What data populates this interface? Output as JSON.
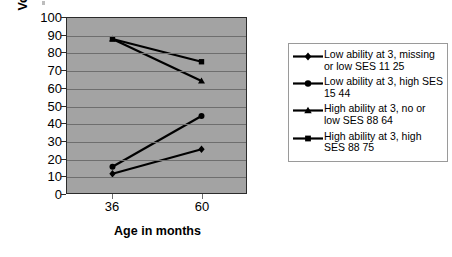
{
  "chart_data": {
    "type": "line",
    "title": "",
    "xlabel": "Age in months",
    "ylabel": "Vocab test percentile",
    "categories": [
      "36",
      "60"
    ],
    "x": [
      36,
      60
    ],
    "ylim": [
      0,
      100
    ],
    "ytick_labels": [
      "100",
      "90",
      "80",
      "70",
      "60",
      "50",
      "40",
      "30",
      "20",
      "10",
      "0"
    ],
    "ytick_values": [
      100,
      90,
      80,
      70,
      60,
      50,
      40,
      30,
      20,
      10,
      0
    ],
    "grid": true,
    "legend_position": "right",
    "series": [
      {
        "name": "Low ability at 3, missing or low SES 11 25",
        "marker": "diamond",
        "values": [
          11,
          25
        ]
      },
      {
        "name": "Low ability at 3, high SES 15 44",
        "marker": "circle",
        "values": [
          15,
          44
        ]
      },
      {
        "name": "High ability at 3, no or low SES 88 64",
        "marker": "triangle",
        "values": [
          88,
          64
        ]
      },
      {
        "name": "High ability at 3, high SES 88 75",
        "marker": "square",
        "values": [
          88,
          75
        ]
      }
    ]
  },
  "legend": {
    "entries": [
      {
        "label": "Low ability at 3, missing or low SES 11 25",
        "marker": "diamond"
      },
      {
        "label": "Low ability at 3, high SES 15 44",
        "marker": "circle"
      },
      {
        "label": "High ability at 3, no or low SES 88 64",
        "marker": "triangle"
      },
      {
        "label": "High ability at 3, high SES 88 75",
        "marker": "square"
      }
    ]
  },
  "colors": {
    "plot_background": "#a3a3a3",
    "gridline": "#6e6e6e",
    "series_line": "#000000",
    "axis": "#2b2b2b",
    "legend_border": "#9a9a9a",
    "page_background": "#ffffff"
  }
}
